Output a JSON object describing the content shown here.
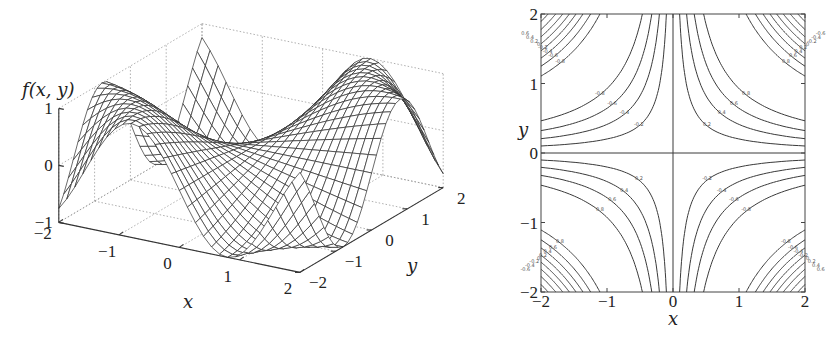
{
  "chart_data": [
    {
      "type": "surface",
      "function": "f(x,y) = sin(x*y)",
      "title": "",
      "zlabel": "f(x, y)",
      "xlabel": "x",
      "ylabel": "y",
      "xlim": [
        -2,
        2
      ],
      "ylim": [
        -2,
        2
      ],
      "zlim": [
        -1,
        1
      ],
      "xticks": [
        "-2",
        "-1",
        "0",
        "1",
        "2"
      ],
      "yticks": [
        "-2",
        "-1",
        "0",
        "1",
        "2"
      ],
      "zticks": [
        "-1",
        "0",
        "1"
      ],
      "grid": true,
      "mesh_resolution": 31
    },
    {
      "type": "contour",
      "function": "f(x,y) = sin(x*y)",
      "title": "",
      "xlabel": "x",
      "ylabel": "y",
      "xlim": [
        -2,
        2
      ],
      "ylim": [
        -2,
        2
      ],
      "xticks": [
        "-2",
        "-1",
        "0",
        "1",
        "2"
      ],
      "yticks": [
        "-2",
        "-1",
        "0",
        "1",
        "2"
      ],
      "levels": [
        -0.8,
        -0.6,
        -0.4,
        -0.2,
        0,
        0.2,
        0.4,
        0.6,
        0.8
      ],
      "level_labels": [
        "-0.8",
        "-0.6",
        "-0.4",
        "-0.2",
        "0",
        "0.2",
        "0.4",
        "0.6",
        "0.8"
      ]
    }
  ],
  "labels": {
    "surface_zlabel": "f(x, y)",
    "surface_xlabel": "x",
    "surface_ylabel": "y",
    "contour_xlabel": "x",
    "contour_ylabel": "y"
  },
  "colors": {
    "mesh": "#2b2b2b",
    "axis": "#333333",
    "grid": "#9a9a9a",
    "contour": "#3a3a3a"
  }
}
